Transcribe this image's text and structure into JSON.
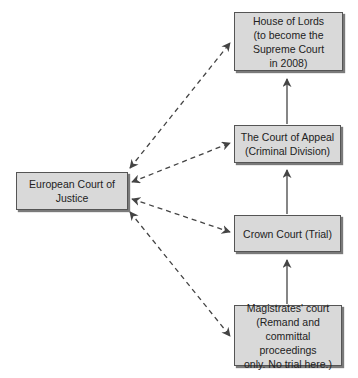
{
  "diagram": {
    "colors": {
      "box_fill": "#d9d9d9",
      "box_border": "#555555",
      "arrow": "#444444",
      "background": "#ffffff"
    },
    "nodes": {
      "ecj": {
        "label": "European Court of\nJustice"
      },
      "house_of_lords": {
        "label": "House of Lords\n(to become the\nSupreme Court\nin 2008)"
      },
      "court_of_appeal": {
        "label": "The Court of Appeal\n(Criminal Division)"
      },
      "crown_court": {
        "label": "Crown Court (Trial)"
      },
      "magistrates_court": {
        "label": "Magistrates' court\n(Remand and\ncommittal proceedings\nonly. No trial here.)"
      }
    },
    "edges": [
      {
        "from": "magistrates_court",
        "to": "crown_court",
        "style": "solid",
        "direction": "one-way"
      },
      {
        "from": "crown_court",
        "to": "court_of_appeal",
        "style": "solid",
        "direction": "one-way"
      },
      {
        "from": "court_of_appeal",
        "to": "house_of_lords",
        "style": "solid",
        "direction": "one-way"
      },
      {
        "from": "ecj",
        "to": "house_of_lords",
        "style": "dashed",
        "direction": "two-way"
      },
      {
        "from": "ecj",
        "to": "court_of_appeal",
        "style": "dashed",
        "direction": "two-way"
      },
      {
        "from": "ecj",
        "to": "crown_court",
        "style": "dashed",
        "direction": "two-way"
      },
      {
        "from": "ecj",
        "to": "magistrates_court",
        "style": "dashed",
        "direction": "two-way"
      }
    ]
  }
}
